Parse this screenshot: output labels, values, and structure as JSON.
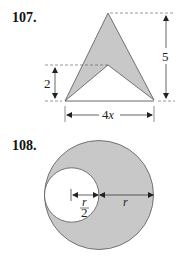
{
  "problems": [
    {
      "number": "107.",
      "figure": "arrowhead-shape",
      "dimensions": {
        "height_total": "5",
        "height_notch": "2",
        "width_base_prefix": "4",
        "width_base_var": "x"
      },
      "colors": {
        "fill": "#c8c8c8",
        "stroke": "#555555"
      }
    },
    {
      "number": "108.",
      "figure": "circle-with-inner-circle",
      "dimensions": {
        "inner_radius_num": "r",
        "inner_radius_den": "2",
        "outer_radius": "r"
      },
      "colors": {
        "fill": "#c8c8c8",
        "stroke": "#555555"
      }
    }
  ]
}
